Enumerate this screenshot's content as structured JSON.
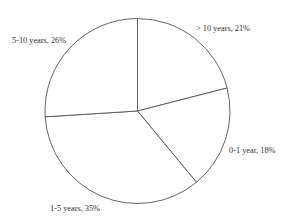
{
  "chart_data": {
    "type": "pie",
    "title": "",
    "categories": [
      "> 10 years",
      "0-1 year",
      "1-5 years",
      "5-10 years"
    ],
    "values": [
      21,
      18,
      35,
      26
    ],
    "unit": "%",
    "labels": [
      "> 10 years, 21%",
      "0-1 year, 18%",
      "1-5 years, 35%",
      "5-10 years, 26%"
    ],
    "start_angle_deg": 0,
    "direction": "clockwise",
    "legend": "none",
    "slice_fill": "#ffffff",
    "slice_stroke": "#555555"
  },
  "layout": {
    "center": [
      137.5,
      111
    ],
    "radius": 92.5,
    "label_positions": [
      {
        "x": 196,
        "y": 31,
        "anchor": "start"
      },
      {
        "x": 229,
        "y": 153,
        "anchor": "start"
      },
      {
        "x": 50,
        "y": 211,
        "anchor": "start"
      },
      {
        "x": 12,
        "y": 43,
        "anchor": "start"
      }
    ]
  }
}
